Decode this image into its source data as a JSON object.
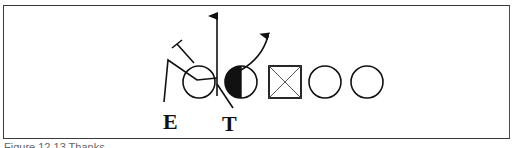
{
  "diagram": {
    "type": "football-play-diagram",
    "labels": {
      "end": "E",
      "tackle": "T"
    },
    "players": [
      {
        "id": "end",
        "shape": "circle",
        "fill": "none",
        "label": "E"
      },
      {
        "id": "tackle",
        "shape": "circle",
        "fill": "left-half-black",
        "label": "T"
      },
      {
        "id": "center",
        "shape": "square-x",
        "fill": "none"
      },
      {
        "id": "guard",
        "shape": "circle",
        "fill": "none"
      },
      {
        "id": "tackle-far",
        "shape": "circle",
        "fill": "none"
      }
    ],
    "routes": [
      {
        "id": "vertical-arrow",
        "kind": "arrow",
        "direction": "up"
      },
      {
        "id": "curved-arrow",
        "kind": "arrow",
        "direction": "up-right"
      },
      {
        "id": "end-block",
        "kind": "block",
        "terminator": "T-bar"
      }
    ],
    "colors": {
      "ink": "#111111",
      "frame": "#3a3a3a",
      "background": "#ffffff"
    }
  },
  "caption": {
    "text": "Figure 12.13  Thanks"
  }
}
